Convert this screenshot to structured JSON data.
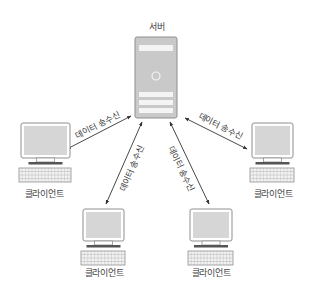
{
  "diagram": {
    "title": "",
    "server": {
      "label": "서버",
      "x": 135,
      "y": 37,
      "w": 42,
      "h": 81
    },
    "clients": [
      {
        "id": "left",
        "label": "클라이언트",
        "mx": 21,
        "my": 123,
        "mw": 49,
        "mh": 35,
        "label_x": 44,
        "label_y": 193
      },
      {
        "id": "bottom-left",
        "label": "클라이언트",
        "mx": 83,
        "my": 209,
        "mw": 41,
        "mh": 32,
        "label_x": 104,
        "label_y": 272
      },
      {
        "id": "bottom-right",
        "label": "클라이언트",
        "mx": 190,
        "my": 209,
        "mw": 42,
        "mh": 32,
        "label_x": 211,
        "label_y": 272
      },
      {
        "id": "right",
        "label": "클라이언트",
        "mx": 252,
        "my": 123,
        "mw": 41,
        "mh": 35,
        "label_x": 273,
        "label_y": 193
      }
    ],
    "connections": [
      {
        "from": "server",
        "to": "left",
        "label": "데이터 송수신",
        "x1": 131,
        "y1": 116,
        "x2": 67,
        "y2": 149,
        "lx": 97,
        "ly": 124,
        "angle": -27
      },
      {
        "from": "server",
        "to": "bottom-left",
        "label": "데이터 송수신",
        "x1": 142,
        "y1": 122,
        "x2": 106,
        "y2": 204,
        "lx": 131,
        "ly": 168,
        "angle": -66
      },
      {
        "from": "server",
        "to": "bottom-right",
        "label": "데이터 송수신",
        "x1": 170,
        "y1": 122,
        "x2": 209,
        "y2": 204,
        "lx": 182,
        "ly": 168,
        "angle": 64
      },
      {
        "from": "server",
        "to": "right",
        "label": "데이터 송수신",
        "x1": 185,
        "y1": 118,
        "x2": 247,
        "y2": 149,
        "lx": 221,
        "ly": 125,
        "angle": 27
      }
    ],
    "colors": {
      "device_fill": "#c9c9c9",
      "device_stroke": "#8f8f8f",
      "screen_fill": "#d6d6d6",
      "bar_fill": "#f4f4f4",
      "arrow": "#333333",
      "stand": "#555555"
    }
  }
}
